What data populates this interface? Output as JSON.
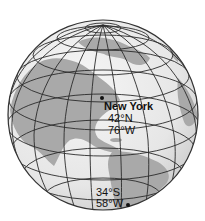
{
  "diagram": {
    "type": "globe-latitude-longitude",
    "colors": {
      "ocean": "#ececec",
      "land": "#a9a9a9",
      "grid": "#2a2a2a",
      "outline": "#333333",
      "text": "#111111"
    },
    "points": [
      {
        "name": "New York",
        "lat": "42°N",
        "lon": "76°W"
      },
      {
        "name": "",
        "lat": "34°S",
        "lon": "58°W"
      }
    ]
  }
}
